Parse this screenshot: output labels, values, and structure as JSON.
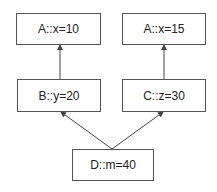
{
  "diagram": {
    "type": "inheritance-graph",
    "nodes": [
      {
        "id": "a1",
        "label": "A::x=10"
      },
      {
        "id": "a2",
        "label": "A::x=15"
      },
      {
        "id": "b",
        "label": "B::y=20"
      },
      {
        "id": "c",
        "label": "C::z=30"
      },
      {
        "id": "d",
        "label": "D::m=40"
      }
    ],
    "edges": [
      {
        "from": "b",
        "to": "a1"
      },
      {
        "from": "c",
        "to": "a2"
      },
      {
        "from": "d",
        "to": "b"
      },
      {
        "from": "d",
        "to": "c"
      }
    ],
    "colors": {
      "border": "#555555",
      "arrow": "#444444",
      "text": "#222222",
      "background": "#ffffff"
    }
  }
}
